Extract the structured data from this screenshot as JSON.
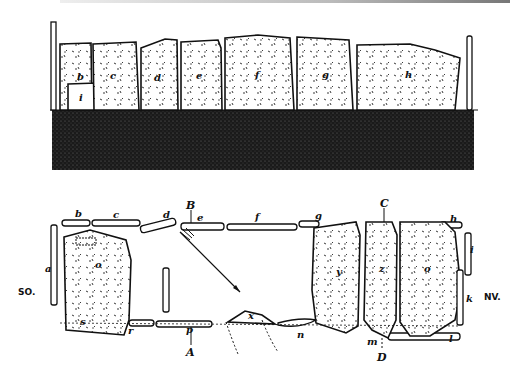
{
  "figure": {
    "type": "archaeological drawing",
    "elevation": {
      "stone_labels": [
        "a",
        "b",
        "c",
        "d",
        "e",
        "f",
        "g",
        "h",
        "i"
      ]
    },
    "plan": {
      "top_labels": [
        "b",
        "c",
        "d",
        "e",
        "f",
        "g",
        "h"
      ],
      "side_labels": [
        "a",
        "i",
        "k",
        "l",
        "m",
        "n",
        "x",
        "y",
        "z",
        "o",
        "p",
        "r",
        "s"
      ],
      "section_markers": [
        "A",
        "B",
        "C",
        "D"
      ],
      "orientation_left": "SO.",
      "orientation_right": "NV."
    }
  }
}
